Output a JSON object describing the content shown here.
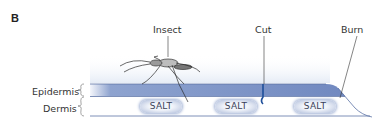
{
  "panel": {
    "letter": "B"
  },
  "labels": {
    "insect": "Insect",
    "cut": "Cut",
    "burn": "Burn",
    "epidermis": "Epidermis",
    "dermis": "Dermis"
  },
  "salt_deposits": [
    "SALT",
    "SALT",
    "SALT"
  ],
  "colors": {
    "epidermis": "#7a92c4",
    "dermis_line": "#5d73a6",
    "salt_glow": "#9fb0d4",
    "cut": "#1f4f9a"
  }
}
